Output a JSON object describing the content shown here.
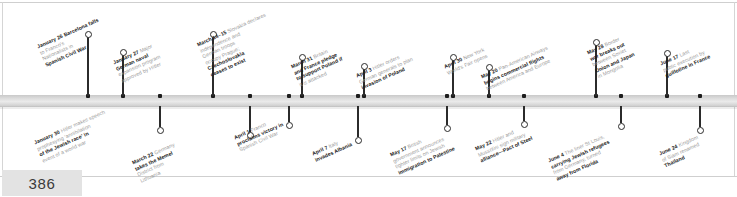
{
  "page": {
    "number": "386",
    "timeline_year_context": "1939"
  },
  "events_above": [
    {
      "date": "January 26",
      "lines": [
        "Barcelona falls",
        "to Franco's",
        "Nationalists in",
        "Spanish Civil War"
      ],
      "bold_lines": [
        0,
        3
      ],
      "x": 88,
      "stem_top": 34,
      "caption_x": 36,
      "caption_y": 44
    },
    {
      "date": "January 27",
      "lines": [
        "Major",
        "German naval",
        "expansion program",
        "approved by Hitler"
      ],
      "bold_lines": [
        1
      ],
      "x": 123,
      "stem_top": 52,
      "caption_x": 112,
      "caption_y": 60
    },
    {
      "date": "March 14–15",
      "lines": [
        "Slovakia declares",
        "independence and",
        "German troops",
        "occupy Prague;",
        "Czechoslovakia",
        "ceases to exist"
      ],
      "bold_lines": [
        4,
        5
      ],
      "x": 213,
      "stem_top": 34,
      "caption_x": 196,
      "caption_y": 42
    },
    {
      "date": "March 31",
      "lines": [
        "Britain",
        "and France pledge",
        "to support Poland if",
        "it is attacked"
      ],
      "bold_lines": [
        1,
        2
      ],
      "x": 302,
      "stem_top": 57,
      "caption_x": 290,
      "caption_y": 64
    },
    {
      "date": "April 3",
      "lines": [
        "Hitler orders",
        "German generals to plan",
        "invasion of Poland"
      ],
      "bold_lines": [
        2
      ],
      "x": 364,
      "stem_top": 66,
      "caption_x": 355,
      "caption_y": 73
    },
    {
      "date": "April 30",
      "lines": [
        "New York",
        "World's Fair opens"
      ],
      "bold_lines": [],
      "x": 453,
      "stem_top": 57,
      "caption_x": 443,
      "caption_y": 64
    },
    {
      "date": "May 20",
      "lines": [
        "Pan-American Airways",
        "begins commercial flights",
        "between America and Europe"
      ],
      "bold_lines": [
        1
      ],
      "x": 489,
      "stem_top": 67,
      "caption_x": 480,
      "caption_y": 74
    },
    {
      "date": "May 28",
      "lines": [
        "Border",
        "war breaks out",
        "between Soviet",
        "Union and Japan",
        "in Mongolia"
      ],
      "bold_lines": [
        1,
        3
      ],
      "x": 596,
      "stem_top": 42,
      "caption_x": 586,
      "caption_y": 50
    },
    {
      "date": "June 17",
      "lines": [
        "Last",
        "public execution by",
        "guillotine in France"
      ],
      "bold_lines": [
        2
      ],
      "x": 667,
      "stem_top": 53,
      "caption_x": 659,
      "caption_y": 61
    }
  ],
  "events_below": [
    {
      "date": "January 30",
      "lines": [
        "Hitler makes speech",
        "prophesying 'annihilation",
        "of the Jewish race' in",
        "event of a world war"
      ],
      "bold_lines": [
        2
      ],
      "x": 160,
      "stem_bottom": 130,
      "caption_x": 33,
      "caption_y": 140
    },
    {
      "date": "March 22",
      "lines": [
        "Germany",
        "takes the Memel",
        "District from",
        "Lithuania"
      ],
      "bold_lines": [
        1
      ],
      "x": 250,
      "stem_bottom": 135,
      "caption_x": 131,
      "caption_y": 160
    },
    {
      "date": "April 1",
      "lines": [
        "Franco",
        "proclaims victory in",
        "Spanish Civil War"
      ],
      "bold_lines": [
        1
      ],
      "x": 289,
      "stem_bottom": 125,
      "caption_x": 233,
      "caption_y": 135
    },
    {
      "date": "April 7",
      "lines": [
        "Italy",
        "invades Albania"
      ],
      "bold_lines": [
        1
      ],
      "x": 358,
      "stem_bottom": 140,
      "caption_x": 311,
      "caption_y": 151
    },
    {
      "date": "May 17",
      "lines": [
        "British",
        "government announces",
        "tighter limits on Jewish",
        "immigration to Palestine"
      ],
      "bold_lines": [
        3
      ],
      "x": 447,
      "stem_bottom": 128,
      "caption_x": 389,
      "caption_y": 152
    },
    {
      "date": "May 22",
      "lines": [
        "Hitler and",
        "Mussolini sign military",
        "alliance—Pact of Steel"
      ],
      "bold_lines": [
        2
      ],
      "x": 524,
      "stem_bottom": 124,
      "caption_x": 474,
      "caption_y": 146
    },
    {
      "date": "June 4",
      "lines": [
        "The liner St Louis,",
        "carrying Jewish refugees",
        "from Germany, turned",
        "away from Florida"
      ],
      "bold_lines": [
        1,
        3
      ],
      "x": 621,
      "stem_bottom": 126,
      "caption_x": 547,
      "caption_y": 158
    },
    {
      "date": "June 24",
      "lines": [
        "Kingdom",
        "of Siam renamed",
        "Thailand"
      ],
      "bold_lines": [
        2
      ],
      "x": 700,
      "stem_bottom": 130,
      "caption_x": 658,
      "caption_y": 151
    }
  ],
  "axis_markers": [
    {
      "x": 88
    },
    {
      "x": 123
    },
    {
      "x": 160
    },
    {
      "x": 213
    },
    {
      "x": 250
    },
    {
      "x": 289
    },
    {
      "x": 302
    },
    {
      "x": 358
    },
    {
      "x": 364
    },
    {
      "x": 447
    },
    {
      "x": 453
    },
    {
      "x": 489
    },
    {
      "x": 524
    },
    {
      "x": 596
    },
    {
      "x": 621
    },
    {
      "x": 667
    },
    {
      "x": 700
    }
  ]
}
